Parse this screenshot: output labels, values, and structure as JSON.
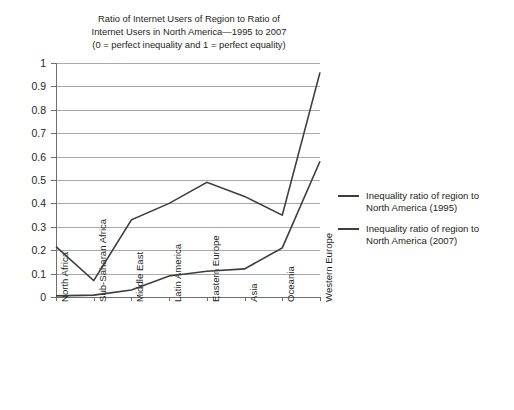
{
  "chart_data": {
    "type": "line",
    "title": "Ratio of Internet Users of Region to Ratio of Internet Users in North America—1995 to 2007 (0 = perfect inequality and 1 = perfect equality)",
    "title_lines": [
      "Ratio of Internet Users of Region to Ratio of",
      "Internet Users in North America—1995 to 2007",
      "(0 = perfect inequality and 1 = perfect equality)"
    ],
    "categories": [
      "North Africa",
      "Sub-Saharan Africa",
      "Middle East",
      "Latin America",
      "Eastern Europe",
      "Asia",
      "Oceania",
      "Western Europe"
    ],
    "series": [
      {
        "name": "Inequality ratio of region to North America (1995)",
        "values": [
          0.005,
          0.008,
          0.03,
          0.09,
          0.11,
          0.12,
          0.21,
          0.58
        ]
      },
      {
        "name": "Inequality ratio of region to North America (2007)",
        "values": [
          0.215,
          0.07,
          0.33,
          0.4,
          0.49,
          0.43,
          0.35,
          0.96
        ]
      }
    ],
    "xlabel": "",
    "ylabel": "",
    "ylim": [
      0,
      1
    ],
    "yticks": [
      "1",
      "0.9",
      "0.8",
      "0.7",
      "0.6",
      "0.5",
      "0.4",
      "0.3",
      "0.2",
      "0.1",
      "0"
    ],
    "ytick_values": [
      1,
      0.9,
      0.8,
      0.7,
      0.6,
      0.5,
      0.4,
      0.3,
      0.2,
      0.1,
      0
    ],
    "grid": true,
    "legend_position": "right",
    "line_color": "#3a3f3c",
    "grid_color": "#a7a9ac",
    "axis_color": "#6d6e71"
  },
  "legend": {
    "entries": [
      {
        "line1": "Inequality ratio of region to",
        "line2": "North America (1995)"
      },
      {
        "line1": "Inequality ratio of region to",
        "line2": "North America (2007)"
      }
    ]
  }
}
